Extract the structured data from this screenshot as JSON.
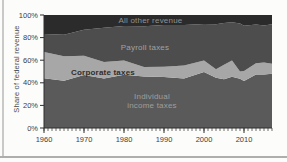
{
  "chart_data": {
    "type": "area",
    "stacked": true,
    "title": "",
    "xlabel": "",
    "ylabel": "Share of federal revenue",
    "ylim": [
      0,
      100
    ],
    "xlim": [
      1960,
      2017
    ],
    "grid": false,
    "legend_position": "labels-inside-areas",
    "x": [
      1960,
      1965,
      1970,
      1975,
      1980,
      1985,
      1990,
      1995,
      2000,
      2003,
      2005,
      2007,
      2009,
      2010,
      2013,
      2015,
      2017
    ],
    "series": [
      {
        "name": "Individual income taxes",
        "color": "#5a5a5a",
        "values": [
          44.0,
          41.8,
          46.9,
          43.9,
          47.2,
          45.6,
          45.2,
          43.7,
          49.6,
          44.5,
          43.1,
          45.3,
          43.5,
          41.5,
          47.4,
          47.4,
          47.9
        ]
      },
      {
        "name": "Corporate taxes",
        "color": "#a7a7a7",
        "values": [
          23.2,
          21.8,
          17.0,
          14.6,
          12.5,
          8.4,
          9.1,
          11.6,
          10.2,
          7.4,
          12.9,
          14.4,
          6.6,
          8.9,
          9.9,
          10.6,
          9.0
        ]
      },
      {
        "name": "Payroll taxes",
        "color": "#4d4d4d",
        "values": [
          15.9,
          19.0,
          23.0,
          30.3,
          30.5,
          36.1,
          36.8,
          35.8,
          32.2,
          40.0,
          36.9,
          33.9,
          42.3,
          40.0,
          34.2,
          32.8,
          35.0
        ]
      },
      {
        "name": "All other revenue",
        "color": "#2b2b2b",
        "values": [
          16.9,
          17.4,
          13.1,
          11.2,
          9.8,
          9.9,
          8.9,
          8.9,
          8.0,
          8.1,
          7.1,
          6.4,
          7.6,
          9.6,
          8.5,
          9.2,
          8.1
        ]
      }
    ],
    "y_ticks": [
      {
        "value": 0,
        "label": "0%"
      },
      {
        "value": 20,
        "label": "20%"
      },
      {
        "value": 40,
        "label": "40%"
      },
      {
        "value": 60,
        "label": "60%"
      },
      {
        "value": 80,
        "label": "80%"
      },
      {
        "value": 100,
        "label": "100%"
      }
    ],
    "x_ticks": [
      {
        "value": 1960,
        "label": "1960"
      },
      {
        "value": 1970,
        "label": "1970"
      },
      {
        "value": 1980,
        "label": "1980"
      },
      {
        "value": 1990,
        "label": "1990"
      },
      {
        "value": 2000,
        "label": "2000"
      },
      {
        "value": 2010,
        "label": "2010"
      }
    ],
    "minor_x_tick_interval": 1
  },
  "colors": {
    "axis": "#2e2e2e",
    "tick_text": "#3c3c3c",
    "page_background": "#fcfcfa",
    "page_edge": "#c9c9c7"
  }
}
